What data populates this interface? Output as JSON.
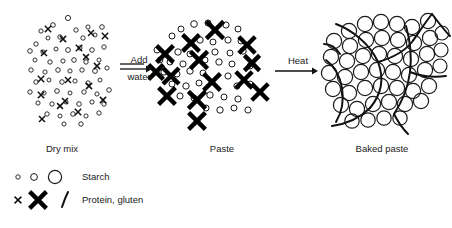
{
  "figure": {
    "background_color": "#ffffff",
    "ink_color": "#1a1a1a"
  },
  "stages": [
    {
      "id": "dry-mix",
      "label": "Dry mix",
      "label_x": 62,
      "label_y": 152,
      "description": "Small ungelatinised starch granules and small protein crosses loosely scattered"
    },
    {
      "id": "paste",
      "label": "Paste",
      "label_x": 222,
      "label_y": 152,
      "description": "Hydrated swollen gluten crosses bold and larger starch granules"
    },
    {
      "id": "baked-paste",
      "label": "Baked paste",
      "label_x": 382,
      "label_y": 152,
      "description": "Large swollen gelatinised starch granules packed within a continuous gluten network"
    }
  ],
  "arrows": [
    {
      "id": "add-water",
      "lines": [
        "Add",
        "water"
      ],
      "line1_x": 139,
      "line1_y": 63,
      "line2_x": 139,
      "line2_y": 80,
      "shaft_x1": 120,
      "shaft_x2": 152,
      "shaft_y": 69,
      "double_rule": true
    },
    {
      "id": "heat",
      "lines": [
        "Heat"
      ],
      "line1_x": 298,
      "line1_y": 64,
      "shaft_x1": 275,
      "shaft_x2": 318,
      "shaft_y": 71,
      "double_rule": false
    }
  ],
  "legend": {
    "rows": [
      {
        "id": "starch",
        "label": "Starch",
        "label_x": 82,
        "label_y": 177,
        "symbols": [
          {
            "kind": "circle",
            "cx": 18,
            "cy": 177,
            "r": 2.2,
            "class": "starch-small"
          },
          {
            "kind": "circle",
            "cx": 34,
            "cy": 177,
            "r": 3.4,
            "class": "starch-med"
          },
          {
            "kind": "circle",
            "cx": 55,
            "cy": 177,
            "r": 6.6,
            "class": "starch-large"
          }
        ]
      },
      {
        "id": "protein-gluten",
        "label": "Protein, gluten",
        "label_x": 82,
        "label_y": 200,
        "symbols": [
          {
            "kind": "cross-small",
            "cx": 18,
            "cy": 200,
            "size": 3.4
          },
          {
            "kind": "cross-big",
            "cx": 38,
            "cy": 200,
            "size": 8.4
          },
          {
            "kind": "strand",
            "path": "M 62 207 C 64 201, 66 196, 68 192"
          }
        ]
      }
    ]
  },
  "panels": {
    "dry_mix": {
      "starch": [
        [
          41,
          31,
          2.1
        ],
        [
          53,
          25,
          2.3
        ],
        [
          68,
          18,
          2.6
        ],
        [
          76,
          30,
          2.2
        ],
        [
          88,
          27,
          2.1
        ],
        [
          102,
          27,
          2.3
        ],
        [
          36,
          44,
          2.2
        ],
        [
          48,
          38,
          2.0
        ],
        [
          60,
          37,
          2.2
        ],
        [
          83,
          38,
          2.2
        ],
        [
          95,
          35,
          2.0
        ],
        [
          30,
          51,
          2.3
        ],
        [
          43,
          52,
          2.1
        ],
        [
          56,
          49,
          2.0
        ],
        [
          68,
          50,
          2.4
        ],
        [
          80,
          48,
          2.1
        ],
        [
          92,
          50,
          2.3
        ],
        [
          104,
          47,
          2.2
        ],
        [
          35,
          60,
          2.0
        ],
        [
          50,
          62,
          2.2
        ],
        [
          63,
          61,
          2.1
        ],
        [
          74,
          60,
          2.3
        ],
        [
          86,
          62,
          2.2
        ],
        [
          99,
          60,
          2.0
        ],
        [
          31,
          70,
          2.2
        ],
        [
          45,
          72,
          2.1
        ],
        [
          58,
          70,
          2.3
        ],
        [
          70,
          71,
          2.1
        ],
        [
          82,
          70,
          2.2
        ],
        [
          95,
          71,
          2.4
        ],
        [
          107,
          68,
          2.1
        ],
        [
          36,
          82,
          2.2
        ],
        [
          49,
          80,
          2.0
        ],
        [
          62,
          82,
          2.3
        ],
        [
          75,
          81,
          2.1
        ],
        [
          88,
          83,
          2.2
        ],
        [
          100,
          80,
          2.0
        ],
        [
          30,
          92,
          2.2
        ],
        [
          44,
          93,
          2.1
        ],
        [
          57,
          91,
          2.3
        ],
        [
          70,
          93,
          2.0
        ],
        [
          84,
          92,
          2.2
        ],
        [
          97,
          94,
          2.1
        ],
        [
          109,
          90,
          2.3
        ],
        [
          38,
          103,
          2.1
        ],
        [
          52,
          104,
          2.2
        ],
        [
          66,
          102,
          2.0
        ],
        [
          79,
          104,
          2.3
        ],
        [
          92,
          102,
          2.1
        ],
        [
          104,
          104,
          2.2
        ],
        [
          47,
          114,
          2.2
        ],
        [
          60,
          116,
          2.0
        ],
        [
          73,
          114,
          2.3
        ],
        [
          86,
          116,
          2.1
        ],
        [
          99,
          113,
          2.2
        ],
        [
          64,
          124,
          2.1
        ],
        [
          81,
          124,
          2.2
        ]
      ],
      "crosses": [
        [
          48,
          29,
          3.2
        ],
        [
          91,
          33,
          3.0
        ],
        [
          63,
          39,
          3.1
        ],
        [
          105,
          36,
          3.2
        ],
        [
          44,
          53,
          3.0
        ],
        [
          79,
          48,
          3.2
        ],
        [
          97,
          66,
          3.1
        ],
        [
          41,
          79,
          3.2
        ],
        [
          68,
          80,
          3.0
        ],
        [
          89,
          86,
          3.1
        ],
        [
          41,
          95,
          3.2
        ],
        [
          65,
          101,
          3.0
        ],
        [
          103,
          100,
          3.1
        ],
        [
          78,
          112,
          3.2
        ],
        [
          42,
          119,
          3.0
        ],
        [
          60,
          106,
          2.9
        ],
        [
          86,
          57,
          2.9
        ]
      ]
    },
    "paste": {
      "starch": [
        [
          181,
          29,
          3.0
        ],
        [
          194,
          24,
          3.3
        ],
        [
          208,
          23,
          3.0
        ],
        [
          226,
          25,
          3.1
        ],
        [
          238,
          29,
          3.0
        ],
        [
          172,
          36,
          3.0
        ],
        [
          200,
          40,
          3.2
        ],
        [
          213,
          42,
          3.0
        ],
        [
          228,
          40,
          3.1
        ],
        [
          241,
          41,
          3.0
        ],
        [
          157,
          50,
          3.0
        ],
        [
          178,
          52,
          3.2
        ],
        [
          190,
          54,
          3.0
        ],
        [
          215,
          52,
          3.1
        ],
        [
          230,
          53,
          3.0
        ],
        [
          243,
          51,
          3.2
        ],
        [
          170,
          62,
          3.0
        ],
        [
          183,
          64,
          3.1
        ],
        [
          205,
          60,
          3.0
        ],
        [
          219,
          62,
          3.2
        ],
        [
          232,
          64,
          3.0
        ],
        [
          164,
          72,
          3.1
        ],
        [
          177,
          74,
          3.0
        ],
        [
          190,
          71,
          3.2
        ],
        [
          203,
          73,
          3.0
        ],
        [
          228,
          76,
          3.1
        ],
        [
          172,
          84,
          3.0
        ],
        [
          186,
          86,
          3.2
        ],
        [
          199,
          83,
          3.0
        ],
        [
          237,
          86,
          3.1
        ],
        [
          250,
          84,
          3.0
        ],
        [
          180,
          96,
          3.1
        ],
        [
          194,
          98,
          3.0
        ],
        [
          210,
          95,
          3.2
        ],
        [
          224,
          97,
          3.0
        ],
        [
          238,
          99,
          3.1
        ],
        [
          206,
          108,
          3.0
        ],
        [
          220,
          110,
          3.2
        ],
        [
          234,
          108,
          3.0
        ],
        [
          248,
          110,
          3.1
        ],
        [
          250,
          66,
          3.0
        ],
        [
          160,
          60,
          2.9
        ]
      ],
      "crosses": [
        [
          215,
          30,
          8.6
        ],
        [
          191,
          43,
          8.4
        ],
        [
          247,
          45,
          8.2
        ],
        [
          165,
          54,
          8.4
        ],
        [
          199,
          60,
          8.6
        ],
        [
          212,
          82,
          8.4
        ],
        [
          244,
          80,
          8.2
        ],
        [
          171,
          76,
          8.0
        ],
        [
          167,
          96,
          8.4
        ],
        [
          197,
          100,
          8.6
        ],
        [
          260,
          92,
          8.2
        ],
        [
          197,
          121,
          8.4
        ],
        [
          252,
          63,
          7.6
        ],
        [
          156,
          72,
          7.4
        ]
      ]
    },
    "baked_paste": {
      "starch": [
        [
          349,
          31,
          7.6
        ],
        [
          365,
          24,
          7.6
        ],
        [
          381,
          22,
          7.6
        ],
        [
          397,
          24,
          7.6
        ],
        [
          412,
          27,
          7.6
        ],
        [
          428,
          21,
          7.6
        ],
        [
          334,
          41,
          7.6
        ],
        [
          350,
          46,
          7.6
        ],
        [
          366,
          40,
          7.6
        ],
        [
          382,
          38,
          7.6
        ],
        [
          398,
          40,
          7.6
        ],
        [
          414,
          43,
          7.6
        ],
        [
          430,
          38,
          7.6
        ],
        [
          442,
          33,
          7.0
        ],
        [
          331,
          57,
          7.6
        ],
        [
          347,
          61,
          7.6
        ],
        [
          363,
          56,
          7.6
        ],
        [
          379,
          54,
          7.6
        ],
        [
          395,
          56,
          7.6
        ],
        [
          411,
          59,
          7.6
        ],
        [
          427,
          54,
          7.6
        ],
        [
          441,
          50,
          7.0
        ],
        [
          329,
          73,
          7.6
        ],
        [
          345,
          77,
          7.6
        ],
        [
          361,
          72,
          7.6
        ],
        [
          377,
          70,
          7.6
        ],
        [
          393,
          72,
          7.6
        ],
        [
          409,
          75,
          7.6
        ],
        [
          425,
          70,
          7.6
        ],
        [
          440,
          66,
          7.0
        ],
        [
          333,
          89,
          7.6
        ],
        [
          349,
          93,
          7.6
        ],
        [
          365,
          88,
          7.6
        ],
        [
          381,
          86,
          7.6
        ],
        [
          397,
          88,
          7.6
        ],
        [
          413,
          91,
          7.6
        ],
        [
          429,
          86,
          7.6
        ],
        [
          341,
          105,
          7.6
        ],
        [
          357,
          109,
          7.6
        ],
        [
          373,
          104,
          7.6
        ],
        [
          389,
          102,
          7.6
        ],
        [
          405,
          104,
          7.6
        ],
        [
          421,
          101,
          7.6
        ],
        [
          352,
          121,
          7.2
        ],
        [
          368,
          120,
          7.2
        ],
        [
          384,
          118,
          7.2
        ],
        [
          400,
          118,
          7.2
        ]
      ],
      "strands": [
        "M 336 24 C 352 30, 370 44, 378 62 C 385 80, 380 96, 370 108",
        "M 370 108 C 360 118, 345 124, 332 126",
        "M 378 62 C 392 58, 404 52, 412 42 C 418 34, 424 24, 432 14",
        "M 406 26 C 410 40, 412 56, 410 72 C 408 88, 402 102, 394 114",
        "M 410 72 C 420 76, 432 78, 446 76",
        "M 326 60 C 334 66, 340 76, 342 88 C 344 100, 342 112, 336 122",
        "M 324 44 C 330 44, 336 48, 340 54",
        "M 432 14 C 438 22, 444 30, 450 36",
        "M 394 114 C 398 122, 402 128, 408 134"
      ]
    }
  }
}
